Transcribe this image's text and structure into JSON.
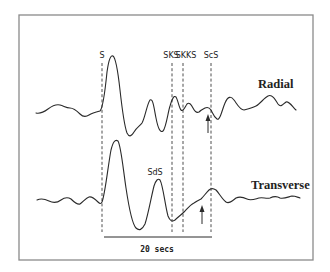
{
  "figure": {
    "colors": {
      "trace": "#2a2a2a",
      "frame": "#8a8a8a",
      "background": "#ffffff"
    }
  },
  "phases": [
    {
      "id": "S",
      "label": "S"
    },
    {
      "id": "SKS",
      "label": "SKS"
    },
    {
      "id": "SKKS",
      "label": "SKKS"
    },
    {
      "id": "ScS",
      "label": "ScS"
    }
  ],
  "traces": {
    "radial": {
      "label": "Radial"
    },
    "transverse": {
      "label": "Transverse",
      "annotation": "SdS"
    }
  },
  "scale_bar": {
    "label": "20 secs",
    "duration_s": 20
  },
  "arrows": [
    {
      "trace": "radial",
      "direction": "up",
      "marks": "arrival near ScS"
    },
    {
      "trace": "transverse",
      "direction": "up",
      "marks": "arrival before ScS"
    }
  ]
}
